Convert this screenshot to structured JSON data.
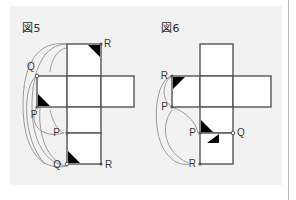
{
  "page": {
    "background_color": "#ffffff",
    "panel_color": "#f2f2f2",
    "border_color": "#b8b8b8",
    "width": 296,
    "height": 200
  },
  "figures": [
    {
      "id": "fig5",
      "caption": "図5",
      "net_type": "cube-net-cross",
      "stroke_color": "#555555",
      "arc_color": "#9a9a9a",
      "marker_color": "#000000",
      "vertex_labels": [
        {
          "text": "R",
          "x": 104,
          "y": 43
        },
        {
          "text": "Q",
          "x": 38,
          "y": 63
        },
        {
          "text": "P",
          "x": 38,
          "y": 110
        },
        {
          "text": "P",
          "x": 60,
          "y": 133
        },
        {
          "text": "Q",
          "x": 57,
          "y": 166
        },
        {
          "text": "R",
          "x": 104,
          "y": 166
        }
      ]
    },
    {
      "id": "fig6",
      "caption": "図6",
      "net_type": "cube-net-cross",
      "stroke_color": "#555555",
      "arc_color": "#9a9a9a",
      "marker_color": "#000000",
      "vertex_labels": [
        {
          "text": "R",
          "x": 163,
          "y": 70
        },
        {
          "text": "P",
          "x": 163,
          "y": 100
        },
        {
          "text": "P",
          "x": 190,
          "y": 134
        },
        {
          "text": "Q",
          "x": 226,
          "y": 134
        },
        {
          "text": "R",
          "x": 190,
          "y": 166
        }
      ]
    }
  ]
}
